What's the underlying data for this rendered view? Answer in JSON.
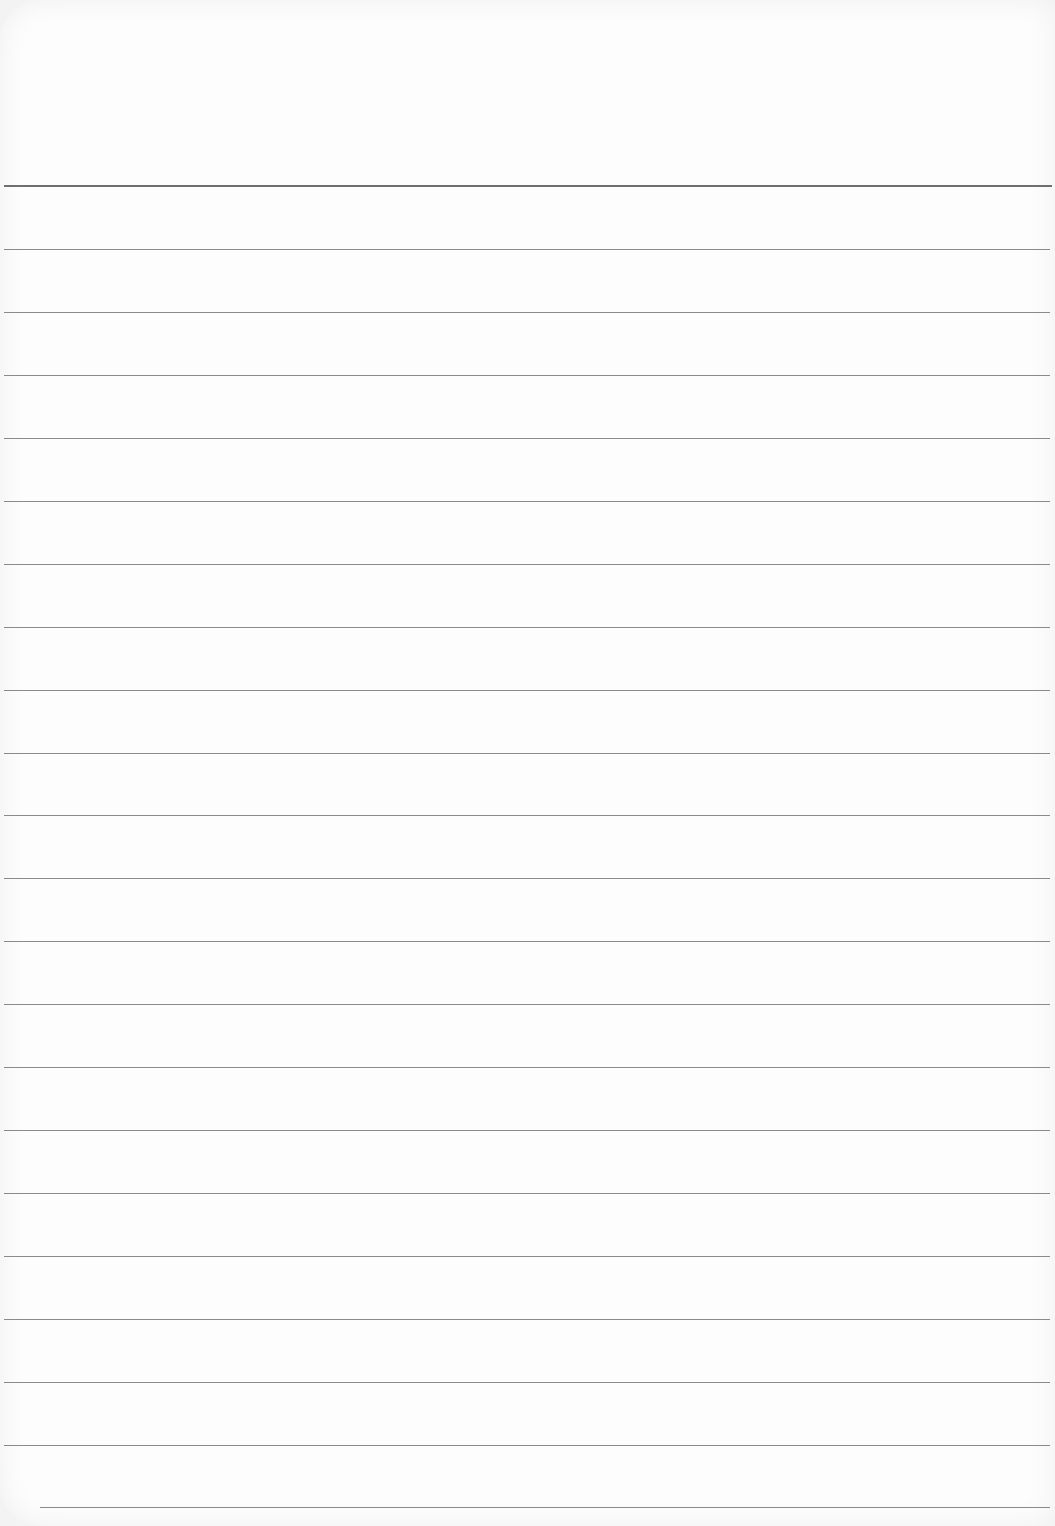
{
  "paper": {
    "type": "ruled notepad sheet",
    "background_color": "#fdfdfd",
    "rule_color": "#8a8a8a",
    "header_rule_color": "#6f6f6f",
    "header_rule_y": 185,
    "rules": [
      {
        "y": 249,
        "x1": 4,
        "x2": 1050
      },
      {
        "y": 312,
        "x1": 4,
        "x2": 1050
      },
      {
        "y": 375,
        "x1": 4,
        "x2": 1050
      },
      {
        "y": 438,
        "x1": 4,
        "x2": 1050
      },
      {
        "y": 501,
        "x1": 4,
        "x2": 1050
      },
      {
        "y": 564,
        "x1": 4,
        "x2": 1050
      },
      {
        "y": 627,
        "x1": 4,
        "x2": 1050
      },
      {
        "y": 690,
        "x1": 4,
        "x2": 1050
      },
      {
        "y": 753,
        "x1": 4,
        "x2": 1050
      },
      {
        "y": 815,
        "x1": 4,
        "x2": 1050
      },
      {
        "y": 878,
        "x1": 4,
        "x2": 1050
      },
      {
        "y": 941,
        "x1": 4,
        "x2": 1050
      },
      {
        "y": 1004,
        "x1": 4,
        "x2": 1050
      },
      {
        "y": 1067,
        "x1": 4,
        "x2": 1050
      },
      {
        "y": 1130,
        "x1": 4,
        "x2": 1050
      },
      {
        "y": 1193,
        "x1": 4,
        "x2": 1050
      },
      {
        "y": 1256,
        "x1": 4,
        "x2": 1050
      },
      {
        "y": 1319,
        "x1": 4,
        "x2": 1050
      },
      {
        "y": 1382,
        "x1": 4,
        "x2": 1050
      },
      {
        "y": 1445,
        "x1": 4,
        "x2": 1050
      },
      {
        "y": 1507,
        "x1": 40,
        "x2": 1050
      }
    ]
  }
}
